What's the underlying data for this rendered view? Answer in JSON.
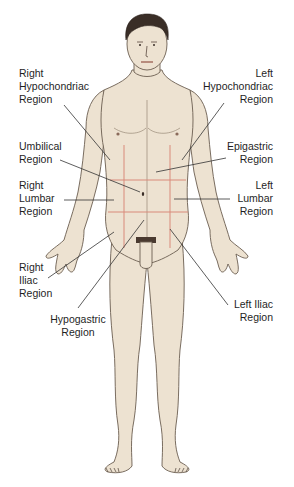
{
  "diagram": {
    "colors": {
      "skin": "#ede2d1",
      "skin_shadow": "#d9c9b2",
      "outline": "#6b5e50",
      "hair": "#3a2e27",
      "grid_lines": "#d98a7a",
      "leader_lines": "#333333",
      "text": "#1f1f1f",
      "background": "#ffffff"
    },
    "labels": {
      "right_hypochondriac": {
        "line1": "Right",
        "line2": "Hypochondriac",
        "line3": "Region"
      },
      "left_hypochondriac": {
        "line1": "Left",
        "line2": "Hypochondriac",
        "line3": "Region"
      },
      "umbilical": {
        "line1": "Umbilical",
        "line2": "Region"
      },
      "epigastric": {
        "line1": "Epigastric",
        "line2": "Region"
      },
      "right_lumbar": {
        "line1": "Right",
        "line2": "Lumbar",
        "line3": "Region"
      },
      "left_lumbar": {
        "line1": "Left",
        "line2": "Lumbar",
        "line3": "Region"
      },
      "right_iliac": {
        "line1": "Right",
        "line2": "Iliac",
        "line3": "Region"
      },
      "hypogastric": {
        "line1": "Hypogastric",
        "line2": "Region"
      },
      "left_iliac": {
        "line1": "Left Iliac",
        "line2": "Region"
      }
    }
  }
}
